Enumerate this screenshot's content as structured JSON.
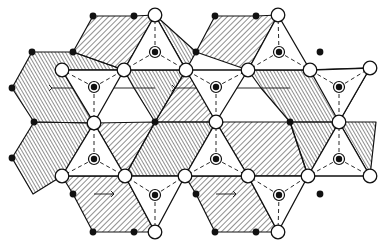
{
  "figure": {
    "type": "crystal-structure-polyhedral-diagram",
    "width": 382,
    "height": 244,
    "colors": {
      "line": "#111111",
      "background": "#ffffff",
      "hatch": "#222222"
    }
  },
  "tetrahedra": [
    {
      "cx": 155,
      "cy": 52,
      "pts": [
        [
          155,
          15
        ],
        [
          124,
          70
        ],
        [
          186,
          70
        ]
      ]
    },
    {
      "cx": 279,
      "cy": 52,
      "pts": [
        [
          278,
          15
        ],
        [
          248,
          70
        ],
        [
          310,
          70
        ]
      ]
    },
    {
      "cx": 94,
      "cy": 87,
      "pts": [
        [
          62,
          70
        ],
        [
          124,
          70
        ],
        [
          94,
          123
        ]
      ]
    },
    {
      "cx": 216,
      "cy": 87,
      "pts": [
        [
          186,
          70
        ],
        [
          248,
          70
        ],
        [
          216,
          122
        ]
      ]
    },
    {
      "cx": 339,
      "cy": 87,
      "pts": [
        [
          310,
          70
        ],
        [
          370,
          68
        ],
        [
          339,
          122
        ]
      ]
    },
    {
      "cx": 94,
      "cy": 159,
      "pts": [
        [
          94,
          123
        ],
        [
          62,
          176
        ],
        [
          125,
          176
        ]
      ]
    },
    {
      "cx": 216,
      "cy": 159,
      "pts": [
        [
          216,
          122
        ],
        [
          185,
          176
        ],
        [
          248,
          176
        ]
      ]
    },
    {
      "cx": 339,
      "cy": 159,
      "pts": [
        [
          339,
          122
        ],
        [
          308,
          176
        ],
        [
          370,
          176
        ]
      ]
    },
    {
      "cx": 155,
      "cy": 195,
      "pts": [
        [
          125,
          176
        ],
        [
          185,
          176
        ],
        [
          155,
          232
        ]
      ]
    },
    {
      "cx": 279,
      "cy": 195,
      "pts": [
        [
          248,
          176
        ],
        [
          308,
          176
        ],
        [
          278,
          232
        ]
      ]
    }
  ],
  "polyhedra": [
    {
      "pts": [
        [
          93,
          16
        ],
        [
          134,
          16
        ],
        [
          155,
          15
        ],
        [
          124,
          70
        ],
        [
          73,
          52
        ]
      ],
      "hatch": "a"
    },
    {
      "pts": [
        [
          32,
          52
        ],
        [
          73,
          52
        ],
        [
          124,
          70
        ],
        [
          62,
          70
        ],
        [
          94,
          123
        ],
        [
          34,
          122
        ],
        [
          12,
          88
        ]
      ],
      "hatch": "b"
    },
    {
      "pts": [
        [
          215,
          16
        ],
        [
          256,
          16
        ],
        [
          278,
          15
        ],
        [
          248,
          70
        ],
        [
          196,
          52
        ]
      ],
      "hatch": "a"
    },
    {
      "pts": [
        [
          155,
          15
        ],
        [
          186,
          70
        ],
        [
          196,
          52
        ]
      ],
      "hatch": "b"
    },
    {
      "pts": [
        [
          310,
          70
        ],
        [
          370,
          68
        ],
        [
          339,
          122
        ],
        [
          290,
          122
        ],
        [
          261,
          88
        ],
        [
          248,
          70
        ]
      ],
      "hatch": "b"
    },
    {
      "pts": [
        [
          124,
          70
        ],
        [
          186,
          70
        ],
        [
          155,
          122
        ],
        [
          134,
          88
        ]
      ],
      "hatch": "b"
    },
    {
      "pts": [
        [
          216,
          122
        ],
        [
          155,
          122
        ],
        [
          186,
          70
        ],
        [
          196,
          86
        ]
      ],
      "hatch": "a"
    },
    {
      "pts": [
        [
          34,
          122
        ],
        [
          94,
          123
        ],
        [
          62,
          176
        ],
        [
          33,
          194
        ],
        [
          12,
          158
        ]
      ],
      "hatch": "b"
    },
    {
      "pts": [
        [
          94,
          123
        ],
        [
          155,
          122
        ],
        [
          125,
          176
        ]
      ],
      "hatch": "a"
    },
    {
      "pts": [
        [
          155,
          122
        ],
        [
          216,
          122
        ],
        [
          185,
          176
        ],
        [
          125,
          176
        ]
      ],
      "hatch": "b"
    },
    {
      "pts": [
        [
          216,
          122
        ],
        [
          290,
          122
        ],
        [
          308,
          176
        ],
        [
          248,
          176
        ]
      ],
      "hatch": "a"
    },
    {
      "pts": [
        [
          290,
          122
        ],
        [
          339,
          122
        ],
        [
          308,
          176
        ]
      ],
      "hatch": "b"
    },
    {
      "pts": [
        [
          62,
          176
        ],
        [
          125,
          176
        ],
        [
          155,
          232
        ],
        [
          93,
          232
        ],
        [
          73,
          194
        ]
      ],
      "hatch": "a"
    },
    {
      "pts": [
        [
          185,
          176
        ],
        [
          248,
          176
        ],
        [
          278,
          232
        ],
        [
          215,
          232
        ],
        [
          196,
          194
        ]
      ],
      "hatch": "a"
    },
    {
      "pts": [
        [
          339,
          122
        ],
        [
          376,
          122
        ],
        [
          370,
          176
        ]
      ],
      "hatch": "b"
    }
  ],
  "filled_dots": [
    [
      93,
      16
    ],
    [
      134,
      16
    ],
    [
      215,
      16
    ],
    [
      256,
      16
    ],
    [
      32,
      52
    ],
    [
      73,
      52
    ],
    [
      196,
      52
    ],
    [
      320,
      52
    ],
    [
      12,
      88
    ],
    [
      155,
      122
    ],
    [
      290,
      122
    ],
    [
      34,
      122
    ],
    [
      12,
      158
    ],
    [
      73,
      194
    ],
    [
      196,
      194
    ],
    [
      320,
      194
    ],
    [
      93,
      232
    ],
    [
      134,
      232
    ],
    [
      215,
      232
    ],
    [
      256,
      232
    ]
  ],
  "open_circles": [
    [
      155,
      15
    ],
    [
      278,
      15
    ],
    [
      62,
      70
    ],
    [
      124,
      70
    ],
    [
      186,
      70
    ],
    [
      248,
      70
    ],
    [
      310,
      70
    ],
    [
      370,
      68
    ],
    [
      94,
      123
    ],
    [
      216,
      122
    ],
    [
      339,
      122
    ],
    [
      62,
      176
    ],
    [
      125,
      176
    ],
    [
      185,
      176
    ],
    [
      248,
      176
    ],
    [
      308,
      176
    ],
    [
      370,
      176
    ],
    [
      155,
      232
    ],
    [
      278,
      232
    ]
  ],
  "arrows": [
    {
      "from": [
        155,
        88
      ],
      "to": [
        52,
        88
      ]
    },
    {
      "from": [
        290,
        88
      ],
      "to": [
        175,
        88
      ]
    },
    {
      "from": [
        94,
        194
      ],
      "to": [
        114,
        194
      ]
    },
    {
      "from": [
        216,
        194
      ],
      "to": [
        236,
        194
      ]
    }
  ]
}
